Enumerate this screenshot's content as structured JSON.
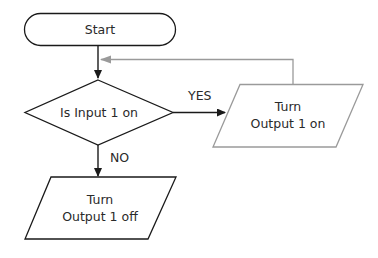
{
  "diagram": {
    "type": "flowchart",
    "nodes": {
      "start": {
        "shape": "terminal",
        "label": "Start"
      },
      "decision": {
        "shape": "decision",
        "label": "Is Input 1 on"
      },
      "output_on": {
        "shape": "io-parallelogram",
        "line1": "Turn",
        "line2": "Output 1 on"
      },
      "output_off": {
        "shape": "io-parallelogram",
        "line1": "Turn",
        "line2": "Output 1 off"
      }
    },
    "edges": {
      "start_to_decision": {
        "from": "start",
        "to": "decision",
        "label": ""
      },
      "yes": {
        "from": "decision",
        "to": "output_on",
        "label": "YES"
      },
      "no": {
        "from": "decision",
        "to": "output_off",
        "label": "NO"
      },
      "loop_back": {
        "from": "output_on",
        "to": "decision",
        "label": ""
      }
    },
    "colors": {
      "primary_stroke": "#1a1a1a",
      "secondary_stroke": "#9a9a9a",
      "text": "#2a2a2a",
      "background": "#ffffff"
    }
  }
}
